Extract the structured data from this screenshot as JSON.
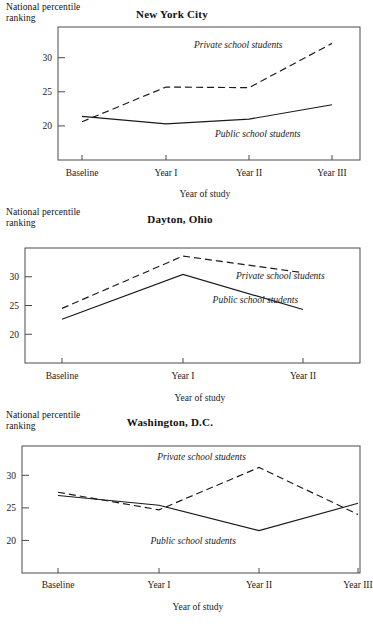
{
  "figure": {
    "axis_label_y": "National percentile\nranking",
    "axis_label_x": "Year of study",
    "series_names": {
      "private": "Private school students",
      "public": "Public school students"
    },
    "ink_color": "#1a1a1a",
    "frame_color": "#4a4a4a"
  },
  "chart_data": [
    {
      "type": "line",
      "title": "New York City",
      "xlabel": "Year of study",
      "ylabel": "National percentile ranking",
      "categories": [
        "Baseline",
        "Year I",
        "Year II",
        "Year III"
      ],
      "yticks": [
        20,
        25,
        30
      ],
      "ylim": [
        15,
        34.5
      ],
      "grid": false,
      "legend": "inline-annotation",
      "series": [
        {
          "name": "Private school students",
          "style": "dashed",
          "values": [
            20.6,
            25.7,
            25.6,
            32.1
          ]
        },
        {
          "name": "Public school students",
          "style": "solid",
          "values": [
            21.4,
            20.3,
            21.0,
            23.1
          ]
        }
      ],
      "annotations": [
        {
          "text": "Private school students",
          "x_frac": 0.45,
          "y_value": 31.4
        },
        {
          "text": "Public school students",
          "x_frac": 0.52,
          "y_value": 18.4
        }
      ]
    },
    {
      "type": "line",
      "title": "Dayton, Ohio",
      "xlabel": "Year of study",
      "ylabel": "National percentile ranking",
      "categories": [
        "Baseline",
        "Year I",
        "Year II"
      ],
      "yticks": [
        20,
        25,
        30
      ],
      "ylim": [
        15,
        35
      ],
      "grid": false,
      "legend": "inline-annotation",
      "series": [
        {
          "name": "Private school students",
          "style": "dashed",
          "values": [
            24.5,
            33.6,
            30.7
          ]
        },
        {
          "name": "Public school students",
          "style": "solid",
          "values": [
            22.6,
            30.4,
            24.3
          ]
        }
      ],
      "annotations": [
        {
          "text": "Private school students",
          "x_frac": 0.63,
          "y_value": 29.6
        },
        {
          "text": "Public school students",
          "x_frac": 0.56,
          "y_value": 25.4
        }
      ]
    },
    {
      "type": "line",
      "title": "Washington, D.C.",
      "xlabel": "Year of study",
      "ylabel": "National percentile ranking",
      "categories": [
        "Baseline",
        "Year I",
        "Year II",
        "Year III"
      ],
      "yticks": [
        20,
        25,
        30
      ],
      "ylim": [
        15,
        34.5
      ],
      "grid": false,
      "legend": "inline-annotation",
      "series": [
        {
          "name": "Private school students",
          "style": "dashed",
          "values": [
            27.4,
            24.7,
            31.2,
            24.0
          ]
        },
        {
          "name": "Public school students",
          "style": "solid",
          "values": [
            26.9,
            25.4,
            21.5,
            25.7
          ]
        }
      ],
      "annotations": [
        {
          "text": "Private school students",
          "x_frac": 0.4,
          "y_value": 32.4
        },
        {
          "text": "Public school students",
          "x_frac": 0.38,
          "y_value": 19.5
        }
      ]
    }
  ]
}
